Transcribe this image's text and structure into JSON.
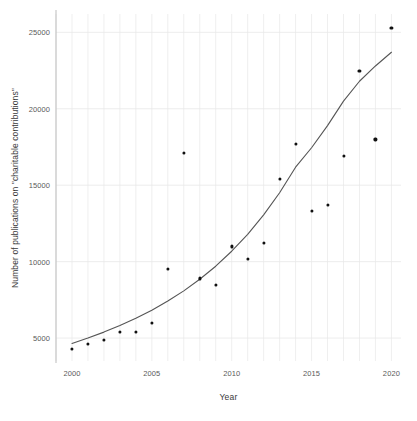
{
  "chart_data": {
    "type": "scatter",
    "title": "",
    "xlabel": "Year",
    "ylabel": "Number of publications on \"charitable contributions\"",
    "xlim": [
      1999,
      2020.6
    ],
    "ylim": [
      3500,
      26200
    ],
    "xticks": [
      2000,
      2005,
      2010,
      2015,
      2020
    ],
    "xtick_labels": [
      "2000",
      "2005",
      "2010",
      "2015",
      "2020"
    ],
    "yticks": [
      5000,
      10000,
      15000,
      20000,
      25000
    ],
    "ytick_labels": [
      "5000",
      "10000",
      "15000",
      "20000",
      "25000"
    ],
    "x_minor_gridlines": true,
    "grid": true,
    "grid_color": "#e8e8e8",
    "legend": "none",
    "marker_color": "#111111",
    "trend_color": "#555555",
    "x": [
      2000,
      2001,
      2002,
      2003,
      2004,
      2005,
      2006,
      2007,
      2008,
      2009,
      2010,
      2011,
      2012,
      2013,
      2014,
      2015,
      2016,
      2017,
      2018,
      2019,
      2020
    ],
    "y": [
      4300,
      4600,
      4900,
      5400,
      5400,
      6000,
      9500,
      17100,
      8900,
      8500,
      11000,
      10200,
      11200,
      15400,
      17700,
      13300,
      13700,
      16900,
      22500,
      18000,
      25300
    ],
    "series": [
      {
        "name": "Publications per year",
        "type": "scatter",
        "values": [
          4300,
          4600,
          4900,
          5400,
          5400,
          6000,
          9500,
          17100,
          8900,
          8500,
          11000,
          10200,
          11200,
          15400,
          17700,
          13300,
          13700,
          16900,
          22500,
          18000,
          25300
        ]
      },
      {
        "name": "Fitted exponential trend",
        "type": "line",
        "x": [
          2000,
          2001,
          2002,
          2003,
          2004,
          2005,
          2006,
          2007,
          2008,
          2009,
          2010,
          2011,
          2012,
          2013,
          2014,
          2015,
          2016,
          2017,
          2018,
          2019,
          2020
        ],
        "values": [
          4650,
          5000,
          5390,
          5820,
          6290,
          6820,
          7420,
          8090,
          8850,
          9700,
          10680,
          11790,
          13060,
          14510,
          16180,
          18090,
          20280,
          22800,
          25700,
          29000,
          32700
        ],
        "visible_range": [
          2000,
          2020
        ],
        "visible_values": [
          4650,
          5000,
          5390,
          5820,
          6290,
          6820,
          7420,
          8090,
          8850,
          9700,
          10680,
          11790,
          13060,
          14510,
          16180,
          17450,
          18900,
          20500,
          21800,
          22800,
          23700
        ]
      }
    ]
  },
  "axes": {
    "x_title": "Year",
    "y_title": "Number of publications on \"charitable contributions\""
  }
}
